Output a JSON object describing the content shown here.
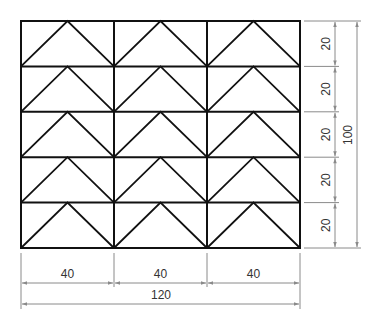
{
  "drawing": {
    "type": "technical-dimension-drawing",
    "grid": {
      "columns": 3,
      "rows": 5
    },
    "cell_pattern": "triangle-chevron",
    "colors": {
      "outline": "#111111",
      "dimension": "#8a8a8a",
      "text": "#333333",
      "background": "#ffffff"
    }
  },
  "dimensions": {
    "horizontal": {
      "segments": [
        "40",
        "40",
        "40"
      ],
      "total": "120"
    },
    "vertical": {
      "segments": [
        "20",
        "20",
        "20",
        "20",
        "20"
      ],
      "total": "100"
    }
  }
}
